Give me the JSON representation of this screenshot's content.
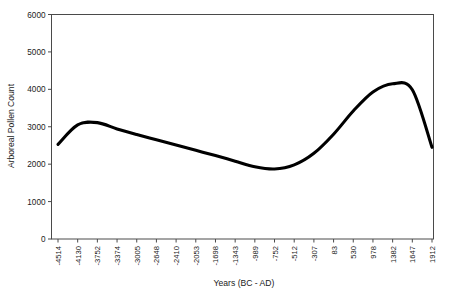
{
  "chart_data": {
    "type": "line",
    "title": "",
    "xlabel": "Years (BC - AD)",
    "ylabel": "Arboreal Pollen Count",
    "grid": false,
    "legend": false,
    "ylim": [
      0,
      6000
    ],
    "ytick_labels": [
      "0",
      "1000",
      "2000",
      "3000",
      "4000",
      "5000",
      "6000"
    ],
    "ytick_values": [
      0,
      1000,
      2000,
      3000,
      4000,
      5000,
      6000
    ],
    "categories": [
      "-4514",
      "-4130",
      "-3752",
      "-3374",
      "-3005",
      "-2648",
      "-2410",
      "-2053",
      "-1698",
      "-1343",
      "-989",
      "-752",
      "-512",
      "-307",
      "83",
      "530",
      "978",
      "1382",
      "1647",
      "1912"
    ],
    "series": [
      {
        "name": "Arboreal Pollen Count",
        "color": "#000000",
        "values": [
          2530,
          3050,
          3110,
          2940,
          2790,
          2650,
          2510,
          2370,
          2230,
          2080,
          1930,
          1870,
          1980,
          2290,
          2800,
          3420,
          3930,
          4150,
          3990,
          2450
        ]
      }
    ]
  },
  "axis": {
    "frame_color": "#4a4a4a"
  }
}
